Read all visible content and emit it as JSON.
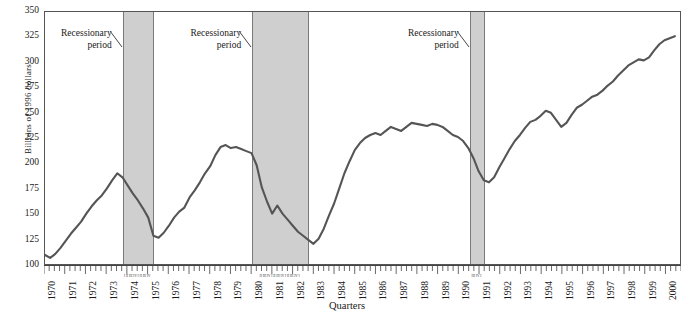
{
  "chart_data": {
    "type": "line",
    "title": "",
    "xlabel": "Quarters",
    "ylabel": "Billions of 1996 dollars",
    "ylim": [
      100,
      350
    ],
    "yticks": [
      350,
      325,
      300,
      275,
      250,
      225,
      200,
      175,
      150,
      125,
      100
    ],
    "xlim": [
      1970,
      2000.75
    ],
    "xticks_years": [
      1970,
      1971,
      1972,
      1973,
      1974,
      1975,
      1976,
      1977,
      1978,
      1979,
      1980,
      1981,
      1982,
      1983,
      1984,
      1985,
      1986,
      1987,
      1988,
      1989,
      1990,
      1991,
      1992,
      1993,
      1994,
      1995,
      1996,
      1997,
      1998,
      1999,
      2000
    ],
    "tick_interval": "quarterly",
    "grid": false,
    "legend": null,
    "series": [
      {
        "name": "Real investment",
        "x": [
          1970.0,
          1970.25,
          1970.5,
          1970.75,
          1971.0,
          1971.25,
          1971.5,
          1971.75,
          1972.0,
          1972.25,
          1972.5,
          1972.75,
          1973.0,
          1973.25,
          1973.5,
          1973.75,
          1974.0,
          1974.25,
          1974.5,
          1974.75,
          1975.0,
          1975.25,
          1975.5,
          1975.75,
          1976.0,
          1976.25,
          1976.5,
          1976.75,
          1977.0,
          1977.25,
          1977.5,
          1977.75,
          1978.0,
          1978.25,
          1978.5,
          1978.75,
          1979.0,
          1979.25,
          1979.5,
          1979.75,
          1980.0,
          1980.25,
          1980.5,
          1980.75,
          1981.0,
          1981.25,
          1981.5,
          1981.75,
          1982.0,
          1982.25,
          1982.5,
          1982.75,
          1983.0,
          1983.25,
          1983.5,
          1983.75,
          1984.0,
          1984.25,
          1984.5,
          1984.75,
          1985.0,
          1985.25,
          1985.5,
          1985.75,
          1986.0,
          1986.25,
          1986.5,
          1986.75,
          1987.0,
          1987.25,
          1987.5,
          1987.75,
          1988.0,
          1988.25,
          1988.5,
          1988.75,
          1989.0,
          1989.25,
          1989.5,
          1989.75,
          1990.0,
          1990.25,
          1990.5,
          1990.75,
          1991.0,
          1991.25,
          1991.5,
          1991.75,
          1992.0,
          1992.25,
          1992.5,
          1992.75,
          1993.0,
          1993.25,
          1993.5,
          1993.75,
          1994.0,
          1994.25,
          1994.5,
          1994.75,
          1995.0,
          1995.25,
          1995.5,
          1995.75,
          1996.0,
          1996.25,
          1996.5,
          1996.75,
          1997.0,
          1997.25,
          1997.5,
          1997.75,
          1998.0,
          1998.25,
          1998.5,
          1998.75,
          1999.0,
          1999.25,
          1999.5,
          1999.75,
          2000.0,
          2000.25,
          2000.5
        ],
        "y": [
          109,
          106,
          110,
          116,
          123,
          130,
          136,
          142,
          150,
          157,
          163,
          168,
          175,
          183,
          190,
          186,
          178,
          170,
          163,
          155,
          146,
          128,
          126,
          131,
          138,
          146,
          152,
          156,
          166,
          173,
          181,
          190,
          197,
          208,
          216,
          218,
          215,
          216,
          214,
          212,
          210,
          198,
          176,
          162,
          150,
          158,
          150,
          144,
          138,
          132,
          128,
          124,
          120,
          125,
          135,
          148,
          160,
          175,
          190,
          202,
          213,
          220,
          225,
          228,
          230,
          228,
          232,
          236,
          234,
          232,
          236,
          240,
          239,
          238,
          237,
          239,
          238,
          236,
          232,
          228,
          226,
          222,
          215,
          205,
          192,
          183,
          181,
          186,
          196,
          205,
          214,
          222,
          228,
          235,
          241,
          243,
          247,
          252,
          250,
          243,
          236,
          240,
          248,
          255,
          258,
          262,
          266,
          268,
          272,
          277,
          281,
          287,
          292,
          297,
          300,
          303,
          302,
          305,
          312,
          318,
          322,
          324,
          326
        ],
        "color": "#555555"
      }
    ],
    "shaded_regions": [
      {
        "label": "Recessionary period",
        "start": 1973.75,
        "end": 1975.25,
        "quarter_labels": "I II III IV I II III IV"
      },
      {
        "label": "Recessionary period",
        "start": 1980.0,
        "end": 1982.75,
        "quarter_labels": "II III IV I II III IV I II III IV I"
      },
      {
        "label": "Recessionary period",
        "start": 1990.5,
        "end": 1991.25,
        "quarter_labels": "III IV I"
      }
    ],
    "annotations": [
      {
        "text_line1": "Recessionary",
        "text_line2": "period",
        "points_to": "band-1"
      },
      {
        "text_line1": "Recessionary",
        "text_line2": "period",
        "points_to": "band-2"
      },
      {
        "text_line1": "Recessionary",
        "text_line2": "period",
        "points_to": "band-3"
      }
    ],
    "colors": {
      "line": "#555555",
      "band_fill": "#cfcfcf",
      "band_border": "#7a7a7a",
      "axis": "#555555",
      "text": "#1a1a1a",
      "background": "#ffffff"
    }
  }
}
